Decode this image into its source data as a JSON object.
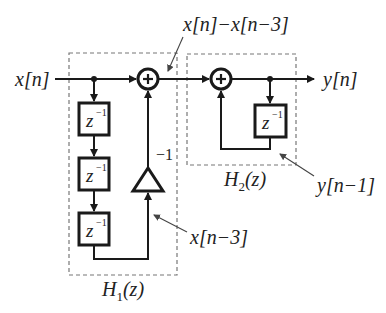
{
  "diagram": {
    "type": "block-diagram",
    "input_label": "x[n]",
    "output_label": "y[n]",
    "intermediate_label": "x[n]−x[n−3]",
    "delayed_input_label": "x[n−3]",
    "delayed_output_label": "y[n−1]",
    "gain_label": "−1",
    "delay_label": "z",
    "delay_exp": "−1",
    "adder_symbol": "+",
    "h1": {
      "name": "H",
      "sub": "1",
      "arg": "(z)"
    },
    "h2": {
      "name": "H",
      "sub": "2",
      "arg": "(z)"
    }
  },
  "colors": {
    "line": "#1a1a1a",
    "dashed": "#777777",
    "text": "#222222"
  }
}
